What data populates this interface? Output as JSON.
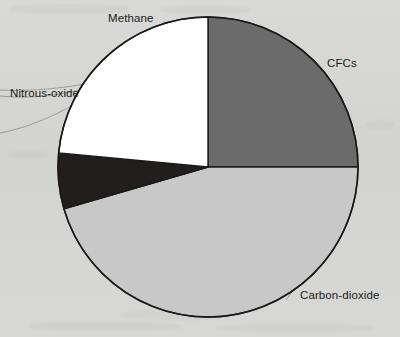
{
  "figure": {
    "title": "",
    "background_color": "#d6d6d4",
    "outline_color": "#1a1a1a"
  },
  "labels": {
    "methane": "Methane",
    "cfcs": "CFCs",
    "nitrous_oxide": "Nitrous-oxide",
    "carbon_dioxide": "Carbon-dioxide"
  },
  "chart_data": {
    "type": "pie",
    "title": "",
    "xlabel": "",
    "ylabel": "",
    "legend_position": "none",
    "grid": false,
    "labels_placement": "outside-with-leader-lines",
    "start_angle_deg": 0,
    "direction": "clockwise",
    "center": {
      "x": 208,
      "y": 167
    },
    "radius": 150,
    "categories": [
      "CFCs",
      "Carbon-dioxide",
      "Nitrous-oxide",
      "Methane"
    ],
    "values": [
      25.0,
      45.5,
      6.0,
      23.5
    ],
    "units": "percent",
    "slices": [
      {
        "name": "CFCs",
        "value": 25.0,
        "start_deg": 0.0,
        "end_deg": 90.0,
        "color": "#6b6b6b",
        "label": "CFCs"
      },
      {
        "name": "Carbon-dioxide",
        "value": 45.5,
        "start_deg": 90.0,
        "end_deg": 253.8,
        "color": "#c8c8c8",
        "label": "Carbon-dioxide"
      },
      {
        "name": "Nitrous-oxide",
        "value": 6.0,
        "start_deg": 253.8,
        "end_deg": 275.4,
        "color": "#221e1e",
        "label": "Nitrous-oxide"
      },
      {
        "name": "Methane",
        "value": 23.5,
        "start_deg": 275.4,
        "end_deg": 360.0,
        "color": "#ffffff",
        "label": "Methane"
      }
    ]
  }
}
